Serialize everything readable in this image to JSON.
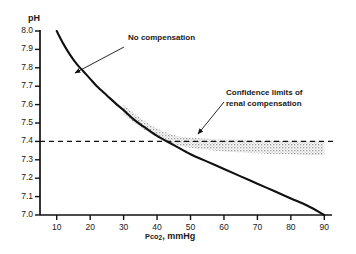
{
  "chart_data": {
    "type": "line",
    "title": "",
    "xlabel": "Pco2, mmHg",
    "ylabel": "pH",
    "xlim": [
      5,
      92
    ],
    "ylim": [
      7.0,
      8.0
    ],
    "grid": false,
    "legend": "none",
    "x_ticks": [
      10,
      20,
      30,
      40,
      50,
      60,
      70,
      80,
      90
    ],
    "x_tick_labels": [
      "10",
      "20",
      "30",
      "40",
      "50",
      "60",
      "70",
      "80",
      "90"
    ],
    "y_ticks": [
      7.0,
      7.1,
      7.2,
      7.3,
      7.4,
      7.5,
      7.6,
      7.7,
      7.8,
      7.9,
      8.0
    ],
    "y_tick_labels": [
      "7.0",
      "7.1",
      "7.2",
      "7.3",
      "7.4",
      "7.5",
      "7.6",
      "7.7",
      "7.8",
      "7.9",
      "8.0"
    ],
    "series": [
      {
        "name": "No compensation",
        "style": "solid-curve",
        "color": "#111111",
        "x": [
          10,
          12,
          14,
          16,
          18,
          20,
          22,
          25,
          28,
          30,
          33,
          36,
          40,
          45,
          50,
          55,
          60,
          65,
          70,
          75,
          80,
          85,
          90
        ],
        "y": [
          8.0,
          7.93,
          7.87,
          7.82,
          7.78,
          7.74,
          7.7,
          7.65,
          7.6,
          7.57,
          7.52,
          7.48,
          7.43,
          7.38,
          7.33,
          7.29,
          7.25,
          7.21,
          7.17,
          7.13,
          7.09,
          7.05,
          7.0
        ]
      }
    ],
    "reference_lines": [
      {
        "name": "normal-pH-reference",
        "orientation": "horizontal",
        "value": 7.4,
        "style": "dashed",
        "color": "#111111"
      }
    ],
    "bands": [
      {
        "name": "Confidence limits of renal compensation",
        "style": "stippled",
        "color": "#b9b9b9",
        "x": [
          30,
          33,
          36,
          40,
          45,
          50,
          55,
          60,
          65,
          70,
          75,
          80,
          85,
          90
        ],
        "y_upper": [
          7.6,
          7.555,
          7.515,
          7.47,
          7.435,
          7.42,
          7.415,
          7.41,
          7.41,
          7.405,
          7.405,
          7.4,
          7.4,
          7.4
        ],
        "y_lower": [
          7.545,
          7.505,
          7.465,
          7.425,
          7.385,
          7.365,
          7.355,
          7.345,
          7.34,
          7.335,
          7.33,
          7.33,
          7.325,
          7.325
        ]
      }
    ],
    "annotations": [
      {
        "name": "no-compensation-label",
        "lines": [
          "No compensation"
        ],
        "text_x_px": 128,
        "text_y_px": 39,
        "arrow_from_px": [
          124,
          47
        ],
        "arrow_to_px": [
          75,
          73
        ]
      },
      {
        "name": "confidence-limits-label",
        "lines": [
          "Confidence limits of",
          "renal compensation"
        ],
        "text_x_px": 226,
        "text_y_px": 94,
        "arrow_from_px": [
          224,
          102
        ],
        "arrow_to_px": [
          198,
          134
        ]
      }
    ]
  },
  "axis": {
    "y_title": "pH",
    "x_title_main": "Pco",
    "x_title_sub": "2",
    "x_title_rest": ", mmHg"
  },
  "annotations_text": {
    "no_compensation": "No compensation",
    "confidence_line1": "Confidence limits of",
    "confidence_line2": "renal compensation"
  },
  "colors": {
    "ink": "#111111",
    "band": "#bdbdbd",
    "background": "#ffffff"
  }
}
